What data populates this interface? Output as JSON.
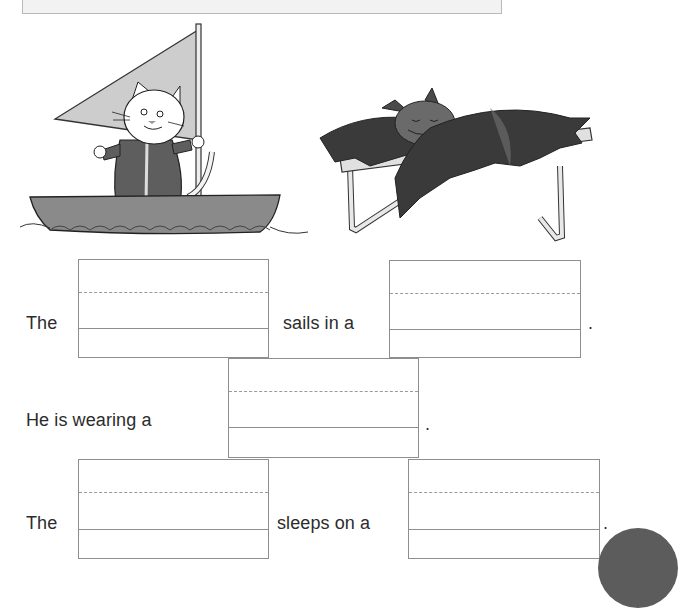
{
  "worksheet": {
    "illustrations": [
      {
        "id": "cat-sailboat",
        "description": "Cat wearing a coat, standing in a sailboat holding the mast"
      },
      {
        "id": "bat-bed",
        "description": "Bat sleeping on a camp bed with wings spread"
      }
    ],
    "sentences": [
      {
        "parts": [
          {
            "type": "text",
            "value": "The"
          },
          {
            "type": "blank",
            "value": "",
            "name": "animal-1-blank"
          },
          {
            "type": "text",
            "value": "sails in a"
          },
          {
            "type": "blank",
            "value": "",
            "name": "vehicle-blank"
          },
          {
            "type": "text",
            "value": "."
          }
        ]
      },
      {
        "parts": [
          {
            "type": "text",
            "value": "He is wearing a"
          },
          {
            "type": "blank",
            "value": "",
            "name": "clothing-blank"
          },
          {
            "type": "text",
            "value": "."
          }
        ]
      },
      {
        "parts": [
          {
            "type": "text",
            "value": "The"
          },
          {
            "type": "blank",
            "value": "",
            "name": "animal-2-blank"
          },
          {
            "type": "text",
            "value": "sleeps on a"
          },
          {
            "type": "blank",
            "value": "",
            "name": "furniture-blank"
          },
          {
            "type": "text",
            "value": "."
          }
        ]
      }
    ]
  },
  "colors": {
    "line": "#8e8e8e",
    "dash": "#9a9a9a",
    "text": "#2c2c2c",
    "sail": "#c9c9c9",
    "boat": "#8a8a8a",
    "coat": "#5e5e5e",
    "bat_wing": "#3a3a3a"
  }
}
